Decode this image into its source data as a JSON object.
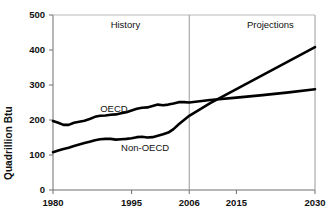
{
  "chart_data": {
    "type": "line",
    "title": "",
    "subtitle": "",
    "xlabel": "",
    "ylabel": "Quadrillion Btu",
    "xlim": [
      1980,
      2030
    ],
    "ylim": [
      0,
      500
    ],
    "ytick_labels": [
      "0",
      "100",
      "200",
      "300",
      "400",
      "500"
    ],
    "ytick_values": [
      0,
      100,
      200,
      300,
      400,
      500
    ],
    "xtick_labels": [
      "1980",
      "1995",
      "2006",
      "2015",
      "2030"
    ],
    "xtick_values": [
      1980,
      1995,
      2006,
      2015,
      2030
    ],
    "grid": false,
    "legend_position": "inline-annotation",
    "annotations": [
      {
        "text": "History",
        "x": 1991,
        "y": 470
      },
      {
        "text": "Projections",
        "x": 2017,
        "y": 470
      },
      {
        "text": "OECD",
        "x": 1989,
        "y": 228
      },
      {
        "text": "Non-OECD",
        "x": 1993,
        "y": 118
      }
    ],
    "divider": {
      "x": 2006,
      "label": "2006",
      "style": "vertical-line"
    },
    "series": [
      {
        "name": "OECD",
        "color": "#000000",
        "x": [
          1980,
          1981,
          1982,
          1983,
          1984,
          1985,
          1986,
          1987,
          1988,
          1989,
          1990,
          1991,
          1992,
          1993,
          1994,
          1995,
          1996,
          1997,
          1998,
          1999,
          2000,
          2001,
          2002,
          2003,
          2004,
          2005,
          2006,
          2010,
          2015,
          2020,
          2025,
          2030
        ],
        "values": [
          197,
          192,
          186,
          186,
          192,
          195,
          198,
          203,
          209,
          212,
          213,
          215,
          216,
          219,
          222,
          227,
          232,
          235,
          236,
          240,
          244,
          242,
          244,
          247,
          251,
          251,
          250,
          257,
          264,
          271,
          279,
          288
        ]
      },
      {
        "name": "Non-OECD",
        "color": "#000000",
        "x": [
          1980,
          1981,
          1982,
          1983,
          1984,
          1985,
          1986,
          1987,
          1988,
          1989,
          1990,
          1991,
          1992,
          1993,
          1994,
          1995,
          1996,
          1997,
          1998,
          1999,
          2000,
          2001,
          2002,
          2003,
          2004,
          2005,
          2006,
          2010,
          2015,
          2020,
          2025,
          2030
        ],
        "values": [
          108,
          113,
          117,
          121,
          126,
          130,
          134,
          138,
          142,
          145,
          146,
          146,
          144,
          145,
          146,
          148,
          151,
          152,
          150,
          151,
          155,
          159,
          164,
          174,
          188,
          200,
          212,
          248,
          288,
          328,
          368,
          408
        ]
      }
    ]
  }
}
